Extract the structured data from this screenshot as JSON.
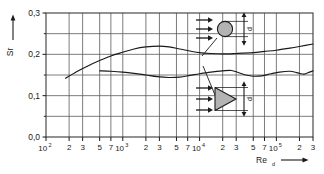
{
  "chart_data": {
    "type": "line",
    "title": "",
    "subtitle": "",
    "xlabel": "Re_d",
    "ylabel": "Sr",
    "xscale": "log",
    "yscale": "linear",
    "xlim": [
      100,
      300000
    ],
    "ylim": [
      0.0,
      0.3
    ],
    "grid": true,
    "legend_position": "none",
    "y_ticks_major": [
      "0,0",
      "0,1",
      "0,2",
      "0,3"
    ],
    "y_tick_values": [
      0.0,
      0.1,
      0.2,
      0.3
    ],
    "y_gridline_values": [
      0.0,
      0.05,
      0.1,
      0.15,
      0.2,
      0.25,
      0.3
    ],
    "x_tick_labels": [
      "10",
      "2",
      "3",
      "5",
      "7",
      "10",
      "2",
      "3",
      "5",
      "7",
      "10",
      "2",
      "3",
      "5",
      "7",
      "10",
      "2",
      "3"
    ],
    "x_tick_exponents": [
      "2",
      "",
      "",
      "",
      "",
      "3",
      "",
      "",
      "",
      "",
      "4",
      "",
      "",
      "",
      "",
      "5",
      "",
      ""
    ],
    "x_tick_values": [
      100,
      200,
      300,
      500,
      700,
      1000,
      2000,
      3000,
      5000,
      7000,
      10000,
      20000,
      30000,
      50000,
      70000,
      100000,
      200000,
      300000
    ],
    "series": [
      {
        "name": "circular-cylinder",
        "points": [
          [
            180,
            0.142
          ],
          [
            250,
            0.158
          ],
          [
            350,
            0.172
          ],
          [
            500,
            0.185
          ],
          [
            700,
            0.196
          ],
          [
            1000,
            0.205
          ],
          [
            1400,
            0.213
          ],
          [
            2000,
            0.218
          ],
          [
            3000,
            0.22
          ],
          [
            4000,
            0.218
          ],
          [
            5500,
            0.213
          ],
          [
            7500,
            0.208
          ],
          [
            10000,
            0.204
          ],
          [
            14000,
            0.202
          ],
          [
            20000,
            0.201
          ],
          [
            30000,
            0.202
          ],
          [
            50000,
            0.204
          ],
          [
            70000,
            0.207
          ],
          [
            100000,
            0.21
          ],
          [
            150000,
            0.215
          ],
          [
            200000,
            0.219
          ],
          [
            300000,
            0.225
          ]
        ]
      },
      {
        "name": "wedge-prism",
        "points": [
          [
            500,
            0.16
          ],
          [
            700,
            0.159
          ],
          [
            1000,
            0.157
          ],
          [
            1400,
            0.154
          ],
          [
            2000,
            0.15
          ],
          [
            2800,
            0.146
          ],
          [
            4000,
            0.144
          ],
          [
            5500,
            0.145
          ],
          [
            7500,
            0.149
          ],
          [
            10000,
            0.153
          ],
          [
            14000,
            0.157
          ],
          [
            20000,
            0.16
          ],
          [
            26000,
            0.161
          ],
          [
            32000,
            0.156
          ],
          [
            40000,
            0.15
          ],
          [
            50000,
            0.147
          ],
          [
            65000,
            0.148
          ],
          [
            85000,
            0.153
          ],
          [
            110000,
            0.157
          ],
          [
            150000,
            0.159
          ],
          [
            190000,
            0.155
          ],
          [
            230000,
            0.152
          ],
          [
            270000,
            0.157
          ],
          [
            300000,
            0.16
          ]
        ]
      }
    ],
    "insets": [
      {
        "name": "cylinder-inset",
        "shape": "circle",
        "dimension_label": "d",
        "flow_arrow_count": 3
      },
      {
        "name": "wedge-inset",
        "shape": "triangle",
        "dimension_label": "d",
        "flow_arrow_count": 3
      }
    ],
    "axis_arrow_x": true,
    "axis_arrow_y": true
  },
  "axes": {
    "y_name": "Sr",
    "x_name_base": "Re",
    "x_name_sub": "d"
  },
  "colors": {
    "background": "#ffffff",
    "grid": "#5a5a5a",
    "curve": "#1a1a1a",
    "inset_fill": "#b3b3b3",
    "inset_stroke": "#1a1a1a",
    "text": "#1a1a1a"
  }
}
